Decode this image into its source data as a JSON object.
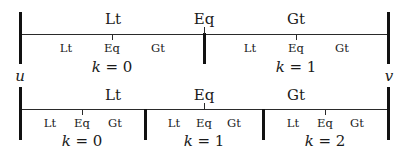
{
  "top": {
    "main_labels": [
      "Lt",
      "Eq",
      "Gt"
    ],
    "segments": [
      {
        "sub_labels": [
          "Lt",
          "Eq",
          "Gt"
        ],
        "k_var": "k",
        "k_eq": " = 0"
      },
      {
        "sub_labels": [
          "Lt",
          "Eq",
          "Gt"
        ],
        "k_var": "k",
        "k_eq": " = 1"
      }
    ],
    "left_vertex": "u",
    "right_vertex": "v"
  },
  "bottom": {
    "main_labels": [
      "Lt",
      "Eq",
      "Gt"
    ],
    "segments": [
      {
        "sub_labels": [
          "Lt",
          "Eq",
          "Gt"
        ],
        "k_var": "k",
        "k_eq": " = 0"
      },
      {
        "sub_labels": [
          "Lt",
          "Eq",
          "Gt"
        ],
        "k_var": "k",
        "k_eq": " = 1"
      },
      {
        "sub_labels": [
          "Lt",
          "Eq",
          "Gt"
        ],
        "k_var": "k",
        "k_eq": " = 2"
      }
    ]
  }
}
